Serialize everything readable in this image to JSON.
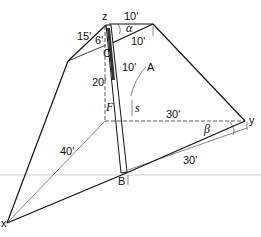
{
  "diagram": {
    "points": {
      "z": "z",
      "x": "x",
      "y": "y",
      "A": "A",
      "B": "B",
      "C": "C"
    },
    "dimensions": {
      "top_left_cable": "15'",
      "top_offset_z": "6'",
      "top_right_top": "10'",
      "top_right_lower": "10'",
      "height_20": "20'",
      "pole_segment": "10'",
      "base_y_dashed": "30'",
      "base_x_dashed": "40'",
      "base_By": "30'"
    },
    "angles": {
      "alpha": "α",
      "beta": "β"
    },
    "variables": {
      "s": "s",
      "force_symbol": "F"
    },
    "colors": {
      "line": "#111111",
      "dashed": "#333333",
      "background": "#ffffff"
    }
  }
}
